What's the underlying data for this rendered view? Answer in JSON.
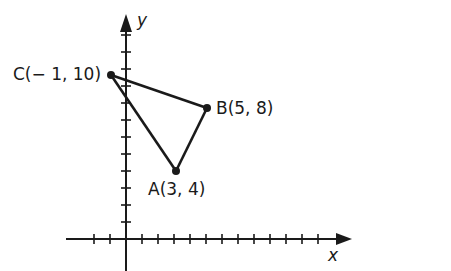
{
  "diagram": {
    "type": "coordinate-plane-triangle",
    "axes": {
      "x_label": "x",
      "y_label": "y"
    },
    "points": [
      {
        "name": "A",
        "label": "A(3, 4)",
        "x": 3,
        "y": 4
      },
      {
        "name": "B",
        "label": "B(5, 8)",
        "x": 5,
        "y": 8
      },
      {
        "name": "C",
        "label": "C(− 1, 10)",
        "x": -1,
        "y": 10
      }
    ],
    "edges": [
      [
        "A",
        "B"
      ],
      [
        "B",
        "C"
      ],
      [
        "C",
        "A"
      ]
    ],
    "colors": {
      "ink": "#1a1a1a",
      "background": "#ffffff"
    }
  }
}
